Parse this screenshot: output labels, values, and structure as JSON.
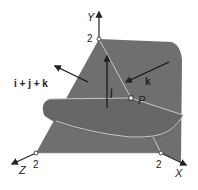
{
  "diagram": {
    "axes": {
      "x_label": "X",
      "y_label": "Y",
      "z_label": "Z"
    },
    "ticks": {
      "x_tick": "2",
      "y_tick": "2",
      "z_tick": "2"
    },
    "point_label": "P",
    "vectors": {
      "normal_sum": "i + j + k",
      "j_vector": "j",
      "k_vector": "k"
    },
    "colors": {
      "surface": "#6f6f6f",
      "curve": "#c8c8c8",
      "axis": "#222222"
    }
  }
}
